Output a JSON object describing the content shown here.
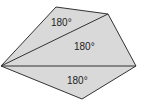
{
  "diagram": {
    "type": "pentagon divided into triangles",
    "fill_color": "#d9d9d9",
    "stroke_color": "#333333",
    "vertices": [
      [
        1,
        66
      ],
      [
        56,
        7
      ],
      [
        108,
        14
      ],
      [
        136,
        66
      ],
      [
        82,
        99
      ]
    ],
    "triangles": [
      {
        "label": "180°",
        "label_pos": [
          62,
          26
        ]
      },
      {
        "label": "180°",
        "label_pos": [
          85,
          50
        ]
      },
      {
        "label": "180°",
        "label_pos": [
          78,
          84
        ]
      }
    ]
  }
}
